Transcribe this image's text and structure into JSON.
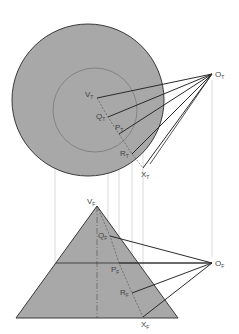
{
  "diagram": {
    "colors": {
      "fill": "#a8a8a8",
      "outline": "#3a3a3a",
      "ray": "#2a2a2a",
      "projector": "#c8c8c8",
      "inner_circle": "#7a7a7a"
    },
    "top_view": {
      "outer_circle": {
        "cx": 88,
        "cy": 100,
        "r": 76
      },
      "inner_circle": {
        "cx": 95,
        "cy": 110,
        "r": 42
      },
      "source": {
        "label": "O",
        "sub": "T",
        "x": 212,
        "y": 74
      },
      "points": [
        {
          "label": "V",
          "sub": "T",
          "x": 97,
          "y": 98
        },
        {
          "label": "Q",
          "sub": "T",
          "x": 108,
          "y": 117
        },
        {
          "label": "P",
          "sub": "T",
          "x": 119,
          "y": 134
        },
        {
          "label": "R",
          "sub": "T",
          "x": 132,
          "y": 154
        },
        {
          "label": "X",
          "sub": "T",
          "x": 143,
          "y": 168
        }
      ]
    },
    "front_view": {
      "triangle": {
        "apex": [
          97,
          206
        ],
        "left": [
          16,
          318
        ],
        "right": [
          178,
          318
        ]
      },
      "source": {
        "label": "O",
        "sub": "F",
        "x": 212,
        "y": 263
      },
      "apex_label": {
        "label": "V",
        "sub": "F"
      },
      "points": [
        {
          "label": "Q",
          "sub": "F",
          "x": 110,
          "y": 236
        },
        {
          "label": "P",
          "sub": "F",
          "x": 119,
          "y": 263
        },
        {
          "label": "R",
          "sub": "F",
          "x": 132,
          "y": 293
        },
        {
          "label": "X",
          "sub": "F",
          "x": 143,
          "y": 317
        }
      ]
    }
  }
}
